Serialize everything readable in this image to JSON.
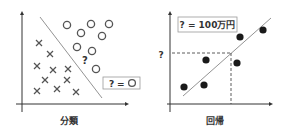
{
  "classification": {
    "caption": "分類",
    "legend_q": "?",
    "legend_eq": "=",
    "unknown_mark": "?",
    "circles": [
      [
        67,
        25
      ],
      [
        81,
        33
      ],
      [
        91,
        24
      ],
      [
        109,
        24
      ],
      [
        77,
        47
      ],
      [
        92,
        51
      ],
      [
        102,
        36
      ],
      [
        96,
        69
      ]
    ],
    "crosses": [
      [
        39,
        43
      ],
      [
        50,
        54
      ],
      [
        37,
        66
      ],
      [
        53,
        70
      ],
      [
        68,
        69
      ],
      [
        45,
        80
      ],
      [
        67,
        80
      ],
      [
        37,
        91
      ],
      [
        57,
        89
      ],
      [
        76,
        92
      ]
    ]
  },
  "regression": {
    "caption": "回帰",
    "label_box": "? = 100万円",
    "y_unknown": "?",
    "points": [
      [
        184,
        87
      ],
      [
        204,
        85
      ],
      [
        206,
        60
      ],
      [
        240,
        37
      ],
      [
        237,
        63
      ],
      [
        263,
        30
      ]
    ]
  },
  "colors": {
    "axis": "#333333",
    "marker": "#555555",
    "point": "#1a1a1a",
    "line": "#666666",
    "box_border": "#999999"
  }
}
